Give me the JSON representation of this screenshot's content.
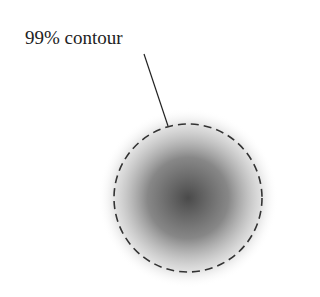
{
  "diagram": {
    "label": "99% contour",
    "blob_color": "#555555",
    "contour_color": "#333333"
  }
}
